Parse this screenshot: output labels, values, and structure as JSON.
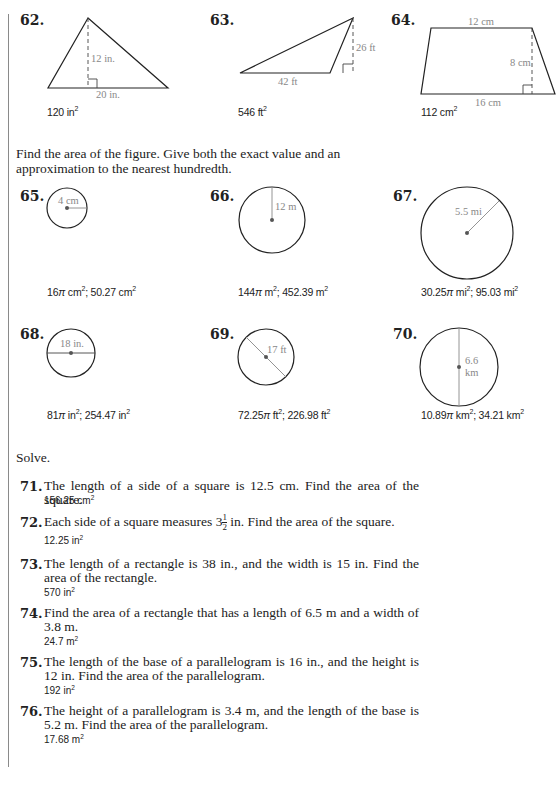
{
  "figures_top": [
    {
      "number": "62.",
      "shape": "triangle",
      "labels": {
        "height": "12 in.",
        "base": "20 in."
      },
      "answer": "120 in",
      "answer_unit_exp": "2"
    },
    {
      "number": "63.",
      "shape": "obtuse-triangle",
      "labels": {
        "height": "26 ft",
        "base": "42 ft"
      },
      "answer": "546 ft",
      "answer_unit_exp": "2"
    },
    {
      "number": "64.",
      "shape": "trapezoid",
      "labels": {
        "top": "12 cm",
        "height": "8 cm",
        "bottom": "16 cm"
      },
      "answer": "112 cm",
      "answer_unit_exp": "2"
    }
  ],
  "instruction_circles": "Find the area of the figure. Give both the exact value and an approximation to the nearest hundredth.",
  "circles": [
    {
      "number": "65.",
      "measure": "radius",
      "label": "4 cm",
      "answer_a": "16",
      "answer_b": " cm",
      "answer_c": "; 50.27 cm"
    },
    {
      "number": "66.",
      "measure": "radius",
      "label": "12 m",
      "answer_a": "144",
      "answer_b": " m",
      "answer_c": "; 452.39 m"
    },
    {
      "number": "67.",
      "measure": "radius",
      "label": "5.5 mi",
      "answer_a": "30.25",
      "answer_b": " mi",
      "answer_c": "; 95.03 mi"
    },
    {
      "number": "68.",
      "measure": "diameter",
      "label": "18 in.",
      "answer_a": "81",
      "answer_b": " in",
      "answer_c": "; 254.47 in"
    },
    {
      "number": "69.",
      "measure": "diameter",
      "label": "17 ft",
      "answer_a": "72.25",
      "answer_b": " ft",
      "answer_c": "; 226.98 ft"
    },
    {
      "number": "70.",
      "measure": "diameter",
      "label_1": "6.6",
      "label_2": "km",
      "answer_a": "10.89",
      "answer_b": " km",
      "answer_c": "; 34.21 km"
    }
  ],
  "pi_symbol": "π",
  "sq": "2",
  "instruction_solve": "Solve.",
  "problems": [
    {
      "number": "71.",
      "text": "The length of a side of a square is 12.5 cm. Find the area of the square.",
      "answer": "156.25 cm"
    },
    {
      "number": "72.",
      "text_before": "Each side of a square measures 3",
      "frac_num": "1",
      "frac_den": "2",
      "text_after": " in. Find the area of the square.",
      "answer": "12.25 in"
    },
    {
      "number": "73.",
      "text": "The length of a rectangle is 38 in., and the width is 15 in. Find the area of the rectangle.",
      "answer": "570 in"
    },
    {
      "number": "74.",
      "text": "Find the area of a rectangle that has a length of 6.5 m and a width of 3.8 m.",
      "answer": "24.7 m"
    },
    {
      "number": "75.",
      "text": "The length of the base of a parallelogram is 16 in., and the height is 12 in. Find the area of the parallelogram.",
      "answer": "192 in"
    },
    {
      "number": "76.",
      "text": "The height of a parallelogram is 3.4 m, and the length of the base is 5.2 m. Find the area of the parallelogram.",
      "answer": "17.68 m"
    }
  ]
}
